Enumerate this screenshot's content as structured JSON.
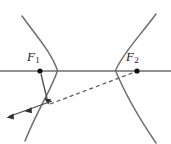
{
  "figure": {
    "type": "hyperbola-reflection-diagram",
    "background_color": "#ffffff",
    "stroke_color": "#6e6e6e",
    "ray_color": "#4a4a4a",
    "dash_color": "#5a5a5a",
    "label_color": "#1a1a1a",
    "marker_color": "#111111",
    "labels": {
      "focus_left": "F",
      "focus_left_sub": "1",
      "focus_right": "F",
      "focus_right_sub": "2"
    },
    "geometry": {
      "axis": {
        "x1": 0,
        "y1": 71,
        "x2": 171,
        "y2": 71
      },
      "focus_left_point": {
        "x": 40,
        "y": 71
      },
      "focus_right_point": {
        "x": 137,
        "y": 71
      },
      "left_branch": {
        "vertex_x": 58,
        "top": {
          "x": 22,
          "y": 16
        },
        "bottom": {
          "x": 25,
          "y": 141
        }
      },
      "right_branch": {
        "vertex_x": 115,
        "top": {
          "x": 156,
          "y": 14
        },
        "bottom": {
          "x": 156,
          "y": 143
        }
      },
      "reflection_point": {
        "x": 48,
        "y": 104
      },
      "incident_ray": {
        "from_x": 41,
        "from_y": 74,
        "to_x": 48,
        "to_y": 103
      },
      "dashed_line": {
        "from_x": 50,
        "from_y": 104,
        "to_x": 135,
        "to_y": 72
      },
      "outgoing_ray": {
        "from_x": 52,
        "from_y": 101,
        "to_x": 7,
        "to_y": 117
      },
      "outgoing_mid_arrow": {
        "x": 27,
        "y": 110
      },
      "dash_pattern": "4 3"
    }
  }
}
